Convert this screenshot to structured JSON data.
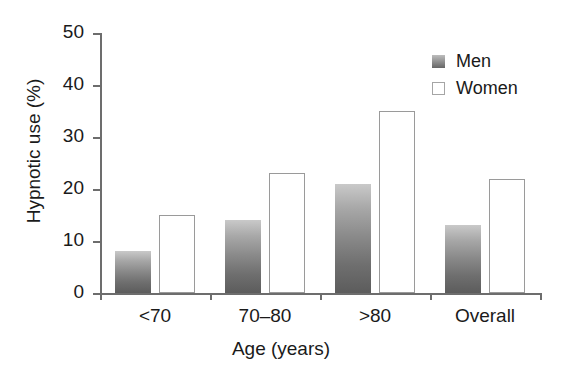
{
  "chart_data": {
    "type": "bar",
    "title": "",
    "xlabel": "Age (years)",
    "ylabel": "Hypnotic use (%)",
    "categories": [
      "<70",
      "70–80",
      ">80",
      "Overall"
    ],
    "series": [
      {
        "name": "Men",
        "values": [
          8,
          14,
          21,
          13
        ],
        "color": "#7a7a7a"
      },
      {
        "name": "Women",
        "values": [
          15,
          23,
          35,
          22
        ],
        "color": "#ffffff"
      }
    ],
    "ylim": [
      0,
      50
    ],
    "yticks": [
      0,
      10,
      20,
      30,
      40,
      50
    ],
    "ytick_labels": [
      "0",
      "10",
      "20",
      "30",
      "40",
      "50"
    ],
    "grid": false,
    "legend_position": "top-right"
  },
  "legend": {
    "entries": [
      {
        "label": "Men",
        "swatch": "filled-gradient-swatch"
      },
      {
        "label": "Women",
        "swatch": "open-white-swatch"
      }
    ]
  }
}
